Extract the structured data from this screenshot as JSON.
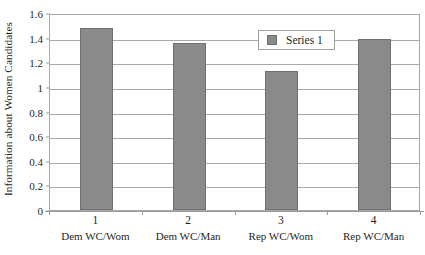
{
  "chart_data": {
    "type": "bar",
    "title": "",
    "subtitle": "",
    "xlabel": "",
    "ylabel": "Information about Women Candidates",
    "categories": [
      "1",
      "2",
      "3",
      "4"
    ],
    "category_sublabels": [
      "Dem WC/Wom",
      "Dem WC/Man",
      "Rep WC/Wom",
      "Rep WC/Man"
    ],
    "values": [
      1.48,
      1.36,
      1.13,
      1.39
    ],
    "series": [
      {
        "name": "Series 1",
        "values": [
          1.48,
          1.36,
          1.13,
          1.39
        ],
        "color": "#8a8a8a"
      }
    ],
    "ylim": [
      0,
      1.6
    ],
    "ytick_labels": [
      "0",
      "0.2",
      "0.4",
      "0.6",
      "0.8",
      "1",
      "1.2",
      "1.4",
      "1.6"
    ],
    "ytick_values": [
      0,
      0.2,
      0.4,
      0.6,
      0.8,
      1,
      1.2,
      1.4,
      1.6
    ],
    "grid": true,
    "grid_axis": "y",
    "legend": {
      "position": "inside-top-right",
      "entries": [
        {
          "label": "Series 1",
          "color": "#8a8a8a"
        }
      ]
    },
    "colors": {
      "bar_fill": "#8a8a8a",
      "bar_border": "#6f6f6f",
      "gridline": "#a8a8a8",
      "axis": "#9a9a9a",
      "plot_border": "#a8a8a8",
      "background": "#ffffff",
      "text": "#1f1f1f"
    }
  }
}
